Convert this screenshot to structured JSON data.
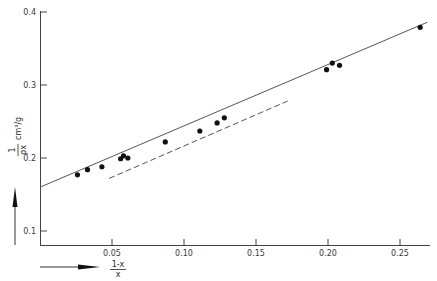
{
  "chart_data": {
    "type": "scatter",
    "title": "",
    "xlabel": "(1-x)/x",
    "xlabel_num": "1-x",
    "xlabel_den": "x",
    "ylabel": "1/ρx cm³/g",
    "ylabel_num": "1",
    "ylabel_den": "ρx",
    "ylabel_units": "cm³/g",
    "xlim": [
      0.0,
      0.27
    ],
    "ylim": [
      0.08,
      0.4
    ],
    "grid": false,
    "x_ticks": [
      0.05,
      0.1,
      0.15,
      0.2,
      0.25
    ],
    "x_tick_labels": [
      "0.05",
      "0.10",
      "0.15",
      "0.20",
      "0.25"
    ],
    "y_ticks": [
      0.1,
      0.2,
      0.3,
      0.4
    ],
    "y_tick_labels": [
      "0.1",
      "0.2",
      "0.3",
      "0.4"
    ],
    "series": [
      {
        "name": "measured",
        "style": "points",
        "x": [
          0.026,
          0.033,
          0.043,
          0.056,
          0.058,
          0.061,
          0.087,
          0.111,
          0.123,
          0.128,
          0.199,
          0.203,
          0.208,
          0.264
        ],
        "y": [
          0.177,
          0.184,
          0.188,
          0.199,
          0.203,
          0.2,
          0.222,
          0.237,
          0.248,
          0.255,
          0.321,
          0.33,
          0.327,
          0.379
        ]
      },
      {
        "name": "fit-solid",
        "style": "solid-line",
        "x": [
          0.0,
          0.269
        ],
        "y": [
          0.16,
          0.386
        ]
      },
      {
        "name": "fit-dashed",
        "style": "dashed-line",
        "x": [
          0.048,
          0.172
        ],
        "y": [
          0.172,
          0.278
        ]
      }
    ],
    "annotations": [
      "vertical arrow along y-axis label",
      "horizontal arrow along x-axis label"
    ]
  }
}
